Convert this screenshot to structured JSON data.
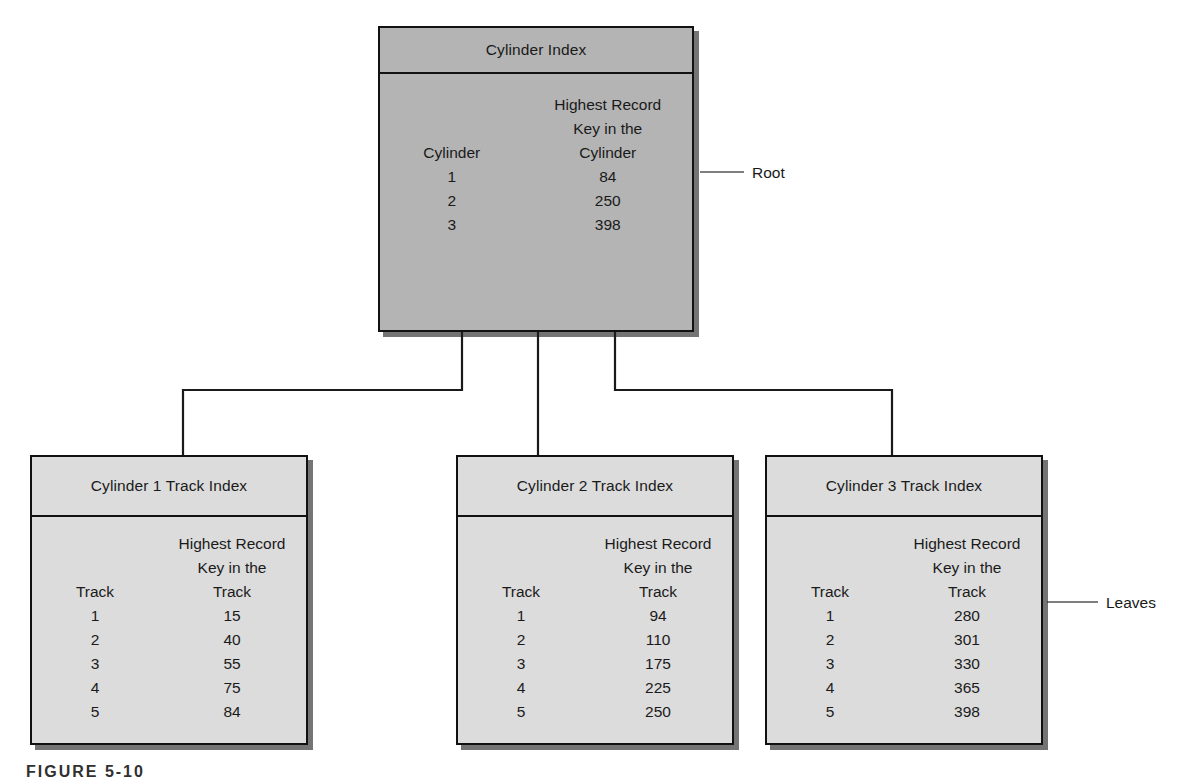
{
  "figure": {
    "caption": "FIGURE 5-10",
    "annotations": {
      "root_label": "Root",
      "leaves_label": "Leaves"
    },
    "colors": {
      "root_fill": "#b4b4b4",
      "leaf_fill": "#dcdcdc",
      "border": "#111111",
      "shadow": "#1e1e1e",
      "text": "#1a1a1a"
    }
  },
  "root": {
    "title": "Cylinder Index",
    "columns": {
      "left_header": "Cylinder",
      "right_header_lines": [
        "Highest Record",
        "Key in the",
        "Cylinder"
      ]
    },
    "rows": [
      {
        "key": "1",
        "value": "84"
      },
      {
        "key": "2",
        "value": "250"
      },
      {
        "key": "3",
        "value": "398"
      }
    ]
  },
  "leaves": [
    {
      "title": "Cylinder 1 Track Index",
      "columns": {
        "left_header": "Track",
        "right_header_lines": [
          "Highest Record",
          "Key in the",
          "Track"
        ]
      },
      "rows": [
        {
          "key": "1",
          "value": "15"
        },
        {
          "key": "2",
          "value": "40"
        },
        {
          "key": "3",
          "value": "55"
        },
        {
          "key": "4",
          "value": "75"
        },
        {
          "key": "5",
          "value": "84"
        }
      ]
    },
    {
      "title": "Cylinder 2 Track Index",
      "columns": {
        "left_header": "Track",
        "right_header_lines": [
          "Highest Record",
          "Key in the",
          "Track"
        ]
      },
      "rows": [
        {
          "key": "1",
          "value": "94"
        },
        {
          "key": "2",
          "value": "110"
        },
        {
          "key": "3",
          "value": "175"
        },
        {
          "key": "4",
          "value": "225"
        },
        {
          "key": "5",
          "value": "250"
        }
      ]
    },
    {
      "title": "Cylinder 3 Track Index",
      "columns": {
        "left_header": "Track",
        "right_header_lines": [
          "Highest Record",
          "Key in the",
          "Track"
        ]
      },
      "rows": [
        {
          "key": "1",
          "value": "280"
        },
        {
          "key": "2",
          "value": "301"
        },
        {
          "key": "3",
          "value": "330"
        },
        {
          "key": "4",
          "value": "365"
        },
        {
          "key": "5",
          "value": "398"
        }
      ]
    }
  ]
}
